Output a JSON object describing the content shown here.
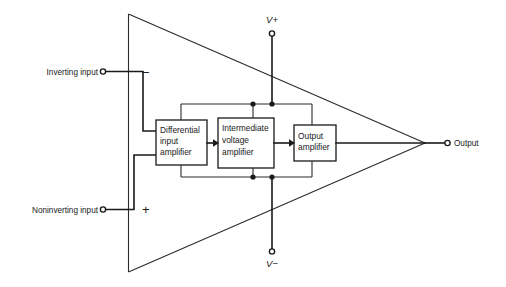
{
  "figure": {
    "colors": {
      "line": "#1a1a1a",
      "background": "#ffffff",
      "text": "#1a1a1a"
    }
  },
  "terminals": {
    "inverting_input": {
      "label": "Inverting input",
      "sign": "−"
    },
    "noninverting_input": {
      "label": "Noninverting input",
      "sign": "+"
    },
    "output": {
      "label": "Output"
    },
    "positive_supply": {
      "label": "V+"
    },
    "negative_supply": {
      "label": "V−"
    }
  },
  "blocks": [
    {
      "name": "differential-input-amplifier",
      "lines": [
        "Differential",
        "input",
        "amplifier"
      ]
    },
    {
      "name": "intermediate-voltage-amplifier",
      "lines": [
        "Intermediate",
        "voltage",
        "amplifier"
      ]
    },
    {
      "name": "output-amplifier",
      "lines": [
        "Output",
        "amplifier"
      ]
    }
  ]
}
